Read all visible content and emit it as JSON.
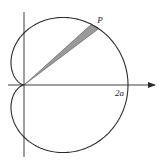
{
  "diagram": {
    "type": "polar-curve",
    "curve": "cardioid",
    "equation": "r = a(1 + cos θ)",
    "labels": {
      "point": "P",
      "x_intercept": "2a"
    },
    "colors": {
      "stroke": "#2a2a2a",
      "sector_fill": "#9a9a9a",
      "background": "#ffffff"
    },
    "geometry": {
      "origin": [
        24,
        85
      ],
      "a_px": 52,
      "sector_theta_deg": [
        37,
        42
      ],
      "point_theta_deg": 40
    }
  }
}
